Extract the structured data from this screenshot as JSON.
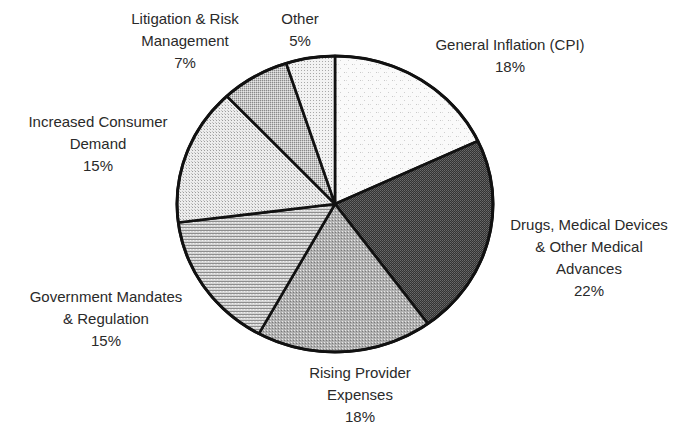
{
  "chart_data": {
    "type": "pie",
    "title": "",
    "start_angle_deg": 0,
    "direction": "clockwise",
    "center": [
      335,
      204
    ],
    "radius": [
      158,
      148
    ],
    "slices": [
      {
        "label_lines": [
          "General Inflation (CPI)"
        ],
        "label": "General Inflation (CPI)",
        "value": 18,
        "value_text": "18%",
        "fill": "#f4f4f4",
        "pattern": "light-grid"
      },
      {
        "label_lines": [
          "Drugs, Medical Devices",
          "& Other Medical",
          "Advances"
        ],
        "label": "Drugs, Medical Devices & Other Medical Advances",
        "value": 22,
        "value_text": "22%",
        "fill": "#4a4a4a",
        "pattern": "dark-checker"
      },
      {
        "label_lines": [
          "Rising Provider",
          "Expenses"
        ],
        "label": "Rising Provider Expenses",
        "value": 18,
        "value_text": "18%",
        "fill": "#a8a8a8",
        "pattern": "medium-dots"
      },
      {
        "label_lines": [
          "Government Mandates",
          "& Regulation"
        ],
        "label": "Government Mandates & Regulation",
        "value": 15,
        "value_text": "15%",
        "fill": "#c2c2c2",
        "pattern": "horizontal-lines"
      },
      {
        "label_lines": [
          "Increased Consumer",
          "Demand"
        ],
        "label": "Increased Consumer Demand",
        "value": 15,
        "value_text": "15%",
        "fill": "#dcdcdc",
        "pattern": "light-dots"
      },
      {
        "label_lines": [
          "Litigation & Risk",
          "Management"
        ],
        "label": "Litigation & Risk Management",
        "value": 7,
        "value_text": "7%",
        "fill": "#b8b8b8",
        "pattern": "dense-dots"
      },
      {
        "label_lines": [
          "Other"
        ],
        "label": "Other",
        "value": 5,
        "value_text": "5%",
        "fill": "#e2e2e2",
        "pattern": "fine-dots"
      }
    ],
    "legend": "none (labels placed around pie)"
  },
  "labels": {
    "inflation": {
      "l1": "General Inflation (CPI)",
      "pct": "18%"
    },
    "drugs": {
      "l1": "Drugs, Medical Devices",
      "l2": "& Other Medical",
      "l3": "Advances",
      "pct": "22%"
    },
    "provider": {
      "l1": "Rising Provider",
      "l2": "Expenses",
      "pct": "18%"
    },
    "government": {
      "l1": "Government Mandates",
      "l2": "& Regulation",
      "pct": "15%"
    },
    "consumer": {
      "l1": "Increased Consumer",
      "l2": "Demand",
      "pct": "15%"
    },
    "litigation": {
      "l1": "Litigation & Risk",
      "l2": "Management",
      "pct": "7%"
    },
    "other": {
      "l1": "Other",
      "pct": "5%"
    }
  }
}
